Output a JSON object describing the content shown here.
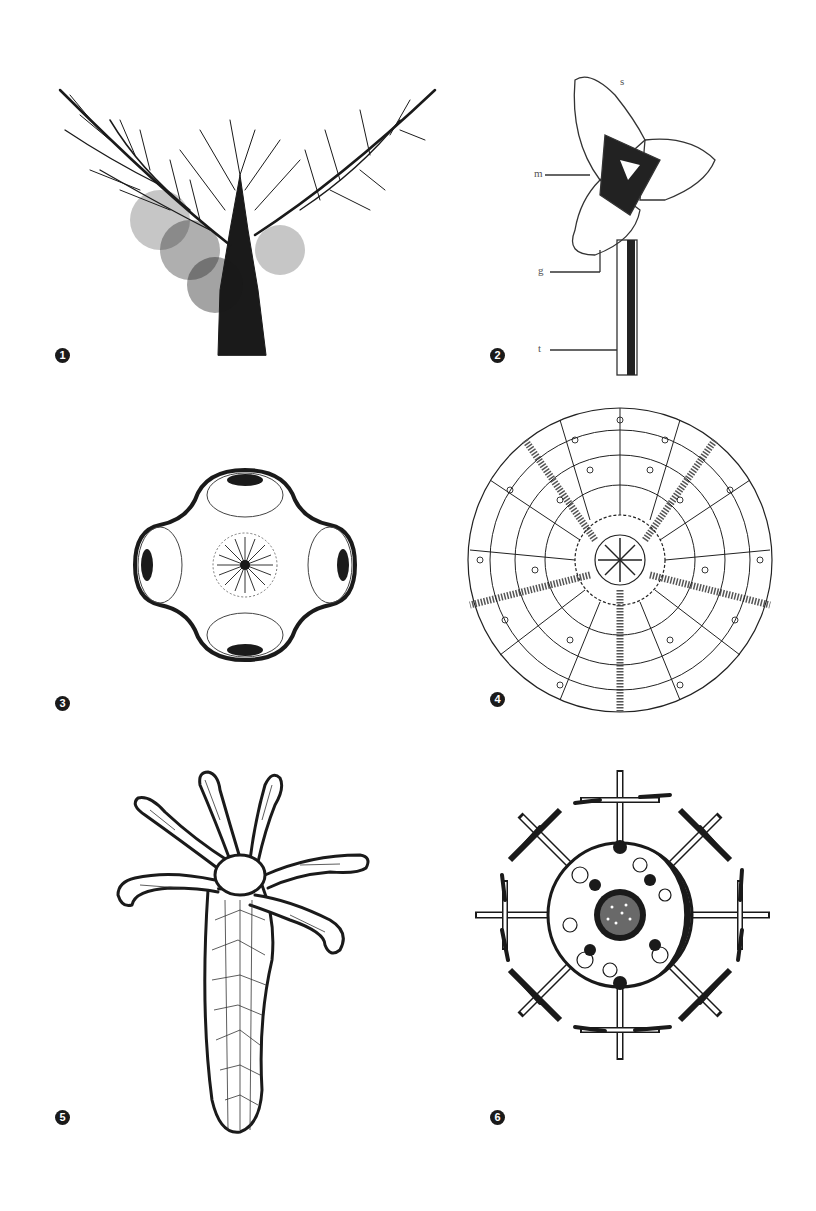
{
  "figure": {
    "panels": [
      {
        "id": 1,
        "marker": "1",
        "subject": "branching-feathery-organism",
        "labels": []
      },
      {
        "id": 2,
        "marker": "2",
        "subject": "three-lobed-head-on-stalk",
        "labels": [
          "s",
          "m",
          "g",
          "t"
        ]
      },
      {
        "id": 3,
        "marker": "3",
        "subject": "four-lobed-radial-body",
        "labels": []
      },
      {
        "id": 4,
        "marker": "4",
        "subject": "plated-circular-test",
        "labels": []
      },
      {
        "id": 5,
        "marker": "5",
        "subject": "hydra-like-polyp",
        "labels": []
      },
      {
        "id": 6,
        "marker": "6",
        "subject": "radiolarian-spined-sphere",
        "labels": []
      }
    ],
    "panel2_labels": {
      "s": "s",
      "m": "m",
      "g": "g",
      "t": "t"
    },
    "colors": {
      "ink": "#1a1a1a",
      "paper": "#ffffff"
    }
  }
}
